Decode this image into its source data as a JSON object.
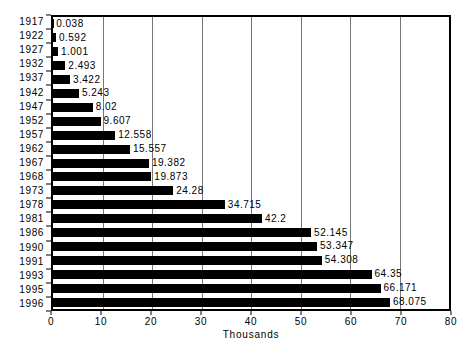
{
  "chart_data": {
    "type": "bar",
    "orientation": "horizontal",
    "title": "",
    "xlabel": "Thousands",
    "ylabel": "",
    "xlim": [
      0,
      80
    ],
    "xticks": [
      0,
      10,
      20,
      30,
      40,
      50,
      60,
      70,
      80
    ],
    "grid": true,
    "legend": "none",
    "categories": [
      "1917",
      "1922",
      "1927",
      "1932",
      "1937",
      "1942",
      "1947",
      "1952",
      "1957",
      "1962",
      "1967",
      "1968",
      "1973",
      "1978",
      "1981",
      "1986",
      "1990",
      "1991",
      "1993",
      "1995",
      "1996"
    ],
    "values": [
      0.038,
      0.592,
      1.001,
      2.493,
      3.422,
      5.243,
      8.02,
      9.607,
      12.558,
      15.557,
      19.382,
      19.873,
      24.28,
      34.715,
      42.2,
      52.145,
      53.347,
      54.308,
      64.35,
      66.171,
      68.075
    ],
    "value_labels": [
      "0.038",
      "0.592",
      "1.001",
      "2.493",
      "3.422",
      "5.243",
      "8.02",
      "9.607",
      "12.558",
      "15.557",
      "19.382",
      "19.873",
      "24.28",
      "34.715",
      "42.2",
      "52.145",
      "53.347",
      "54.308",
      "64.35",
      "66.171",
      "68.075"
    ],
    "bar_color": "#000000",
    "gridline_color": "#777777",
    "axis_color": "#000000",
    "background_color": "#ffffff",
    "text_color": "#000000"
  }
}
